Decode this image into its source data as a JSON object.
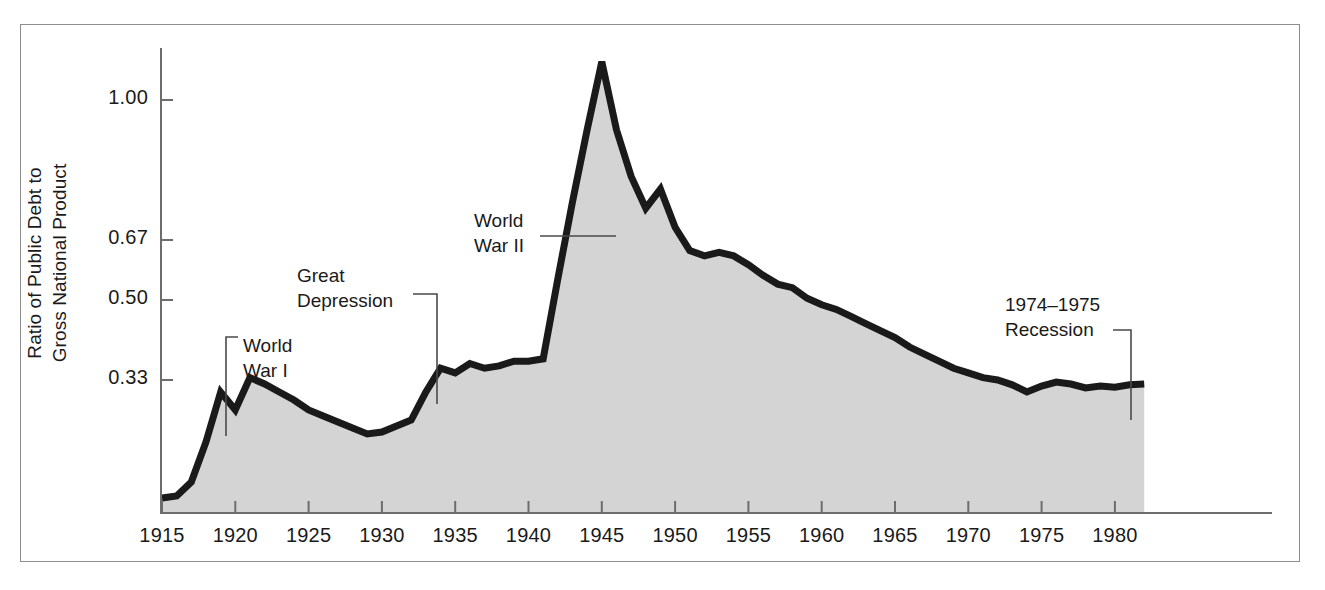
{
  "figure": {
    "background": "#ffffff",
    "frame_color": "#8e8e8e",
    "axis_color": "#6d6d6d"
  },
  "chart_data": {
    "type": "area",
    "title": "",
    "subtitle": "",
    "xlabel": "",
    "ylabel": "Ratio of Public Debt to\nGross National Product",
    "series_name": "Ratio of Public Debt to Gross National Product",
    "line_color": "#1a1a1a",
    "fill_color": "#d4d4d4",
    "grid": false,
    "legend": false,
    "xlim": [
      1915,
      1982
    ],
    "ylim": [
      0.0,
      1.12
    ],
    "xticks": [
      1915,
      1920,
      1925,
      1930,
      1935,
      1940,
      1945,
      1950,
      1955,
      1960,
      1965,
      1970,
      1975,
      1980
    ],
    "xtick_labels": [
      "1915",
      "1920",
      "1925",
      "1930",
      "1935",
      "1940",
      "1945",
      "1950",
      "1955",
      "1960",
      "1965",
      "1970",
      "1975",
      "1980"
    ],
    "yticks": [
      0.33,
      0.5,
      0.67,
      1.0
    ],
    "ytick_labels": [
      "0.33",
      "0.50",
      "0.67",
      "1.00"
    ],
    "x": [
      1915,
      1916,
      1917,
      1918,
      1919,
      1920,
      1921,
      1922,
      1923,
      1924,
      1925,
      1926,
      1927,
      1928,
      1929,
      1930,
      1931,
      1932,
      1933,
      1934,
      1935,
      1936,
      1937,
      1938,
      1939,
      1940,
      1941,
      1942,
      1943,
      1944,
      1945,
      1946,
      1947,
      1948,
      1949,
      1950,
      1951,
      1952,
      1953,
      1954,
      1955,
      1956,
      1957,
      1958,
      1959,
      1960,
      1961,
      1962,
      1963,
      1964,
      1965,
      1966,
      1967,
      1968,
      1969,
      1970,
      1971,
      1972,
      1973,
      1974,
      1975,
      1976,
      1977,
      1978,
      1979,
      1980,
      1981,
      1982
    ],
    "y": [
      0.035,
      0.04,
      0.075,
      0.175,
      0.3,
      0.255,
      0.335,
      0.32,
      0.3,
      0.28,
      0.255,
      0.24,
      0.225,
      0.21,
      0.195,
      0.2,
      0.215,
      0.23,
      0.3,
      0.355,
      0.345,
      0.365,
      0.355,
      0.36,
      0.37,
      0.37,
      0.375,
      0.56,
      0.76,
      0.93,
      1.09,
      0.93,
      0.82,
      0.745,
      0.79,
      0.7,
      0.64,
      0.625,
      0.635,
      0.625,
      0.6,
      0.57,
      0.545,
      0.535,
      0.505,
      0.49,
      0.48,
      0.465,
      0.45,
      0.435,
      0.42,
      0.4,
      0.385,
      0.37,
      0.355,
      0.345,
      0.335,
      0.33,
      0.318,
      0.3,
      0.315,
      0.325,
      0.32,
      0.31,
      0.315,
      0.312,
      0.318,
      0.32
    ],
    "annotations": [
      {
        "id": "world-war-i",
        "text": "World\nWar I",
        "align": "left",
        "x_px": 243,
        "y_px": 333,
        "leader": "elbow-down-left",
        "target_year": 1918,
        "target_value": 0.175
      },
      {
        "id": "great-depression",
        "text": "Great\nDepression",
        "align": "left",
        "x_px": 297,
        "y_px": 263,
        "leader": "elbow-right-down",
        "target_year": 1931,
        "target_value": 0.215
      },
      {
        "id": "world-war-ii",
        "text": "World\nWar II",
        "align": "left",
        "x_px": 474,
        "y_px": 208,
        "leader": "horizontal-right",
        "target_year": 1942,
        "target_value": 0.56
      },
      {
        "id": "recession-1974-1975",
        "text": "1974–1975\nRecession",
        "align": "left",
        "x_px": 1005,
        "y_px": 292,
        "leader": "elbow-right-down",
        "target_year": 1975,
        "target_value": 0.315
      }
    ]
  }
}
